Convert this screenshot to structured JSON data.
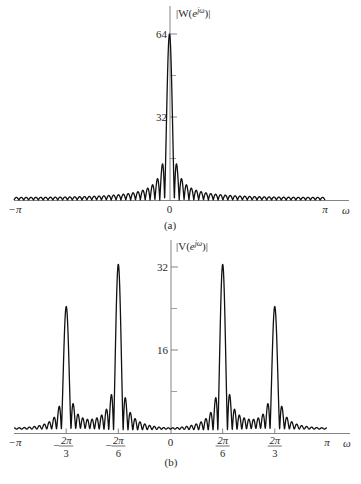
{
  "chart_data": [
    {
      "id": "a",
      "type": "line",
      "title": "(a)",
      "ylabel": "|W(e^{jω})|",
      "ylabel_parts": {
        "pre": "|W(",
        "e": "e",
        "sup": "jω",
        "post": ")|"
      },
      "xlabel": "ω",
      "xlim": [
        "-π",
        "π"
      ],
      "ylim": [
        0,
        64
      ],
      "x_ticks": [
        {
          "value": -3.14159,
          "label": "−π"
        },
        {
          "value": 0,
          "label": "0"
        },
        {
          "value": 3.14159,
          "label": "π"
        }
      ],
      "y_ticks": [
        {
          "value": 64,
          "label": "64"
        },
        {
          "value": 32,
          "label": "32"
        }
      ],
      "y_minor_ticks": [
        16,
        48
      ],
      "window_length_N": 64,
      "description": "Magnitude of DTFT of length-64 rectangular window: main lobe peak 64 at ω=0, decaying sidelobes",
      "components": [
        {
          "center": 0,
          "amplitude": 1
        }
      ],
      "grid": false
    },
    {
      "id": "b",
      "type": "line",
      "title": "(b)",
      "ylabel": "|V(e^{jω})|",
      "ylabel_parts": {
        "pre": "|V(",
        "e": "e",
        "sup": "jω",
        "post": ")|"
      },
      "xlabel": "ω",
      "xlim": [
        "-π",
        "π"
      ],
      "ylim": [
        0,
        32
      ],
      "x_ticks": [
        {
          "value": -3.14159,
          "label": "−π"
        },
        {
          "value": -2.0944,
          "label": "−2π/3",
          "num": "2π",
          "den": "3",
          "neg": true
        },
        {
          "value": -1.0472,
          "label": "−2π/6",
          "num": "2π",
          "den": "6",
          "neg": true
        },
        {
          "value": 0,
          "label": "0"
        },
        {
          "value": 1.0472,
          "label": "2π/6",
          "num": "2π",
          "den": "6",
          "neg": false
        },
        {
          "value": 2.0944,
          "label": "2π/3",
          "num": "2π",
          "den": "3",
          "neg": false
        },
        {
          "value": 3.14159,
          "label": "π"
        }
      ],
      "y_ticks": [
        {
          "value": 32,
          "label": "32"
        },
        {
          "value": 16,
          "label": "16"
        }
      ],
      "y_minor_ticks": [
        8,
        24
      ],
      "window_length_N": 64,
      "description": "Windowed sum of two cosines: peaks of ~32 at ω=±2π/6 and ~24 at ω=±2π/3, with sidelobe leakage",
      "peaks": [
        {
          "omega": "-2π/3",
          "value": 24
        },
        {
          "omega": "-2π/6",
          "value": 32
        },
        {
          "omega": "2π/6",
          "value": 32
        },
        {
          "omega": "2π/3",
          "value": 24
        }
      ],
      "components": [
        {
          "center": 1.0472,
          "amplitude": 0.5
        },
        {
          "center": -1.0472,
          "amplitude": 0.5
        },
        {
          "center": 2.0944,
          "amplitude": 0.375
        },
        {
          "center": -2.0944,
          "amplitude": 0.375
        }
      ],
      "grid": false
    }
  ],
  "style": {
    "line_color": "#111111",
    "axis_color": "#555555",
    "background": "#ffffff"
  }
}
